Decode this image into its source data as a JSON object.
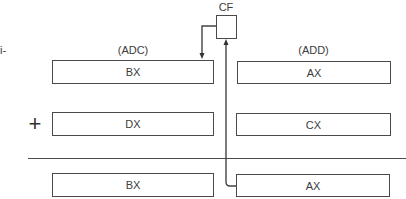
{
  "margin_fragment": "i-",
  "flag": {
    "label": "CF"
  },
  "columns": {
    "left": {
      "instruction": "(ADC)"
    },
    "right": {
      "instruction": "(ADD)"
    }
  },
  "rows": {
    "operand1": {
      "left": "BX",
      "right": "AX"
    },
    "operand2": {
      "left": "DX",
      "right": "CX"
    },
    "result": {
      "left": "BX",
      "right": "AX"
    }
  },
  "operator": "+",
  "colors": {
    "line": "#4a4a4a",
    "text": "#3c3c3c",
    "background": "#ffffff"
  }
}
